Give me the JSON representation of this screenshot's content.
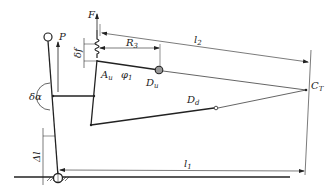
{
  "diagram": {
    "type": "mechanism-linkage",
    "labels": {
      "F": "F",
      "P": "P",
      "delta_f": "δf",
      "R3": "R",
      "R3_sub": "3",
      "l2": "l",
      "l2_sub": "2",
      "l1": "l",
      "l1_sub": "1",
      "Au": "A",
      "Au_sub": "u",
      "phi1": "φ",
      "phi1_sub": "1",
      "Du": "D",
      "Du_sub": "u",
      "Dd": "D",
      "Dd_sub": "d",
      "CT": "C",
      "CT_sub": "T",
      "delta_alpha": "δα",
      "delta_l": "Δl"
    },
    "colors": {
      "line": "#222222",
      "node_fill": "#999999",
      "background": "#ffffff"
    }
  }
}
